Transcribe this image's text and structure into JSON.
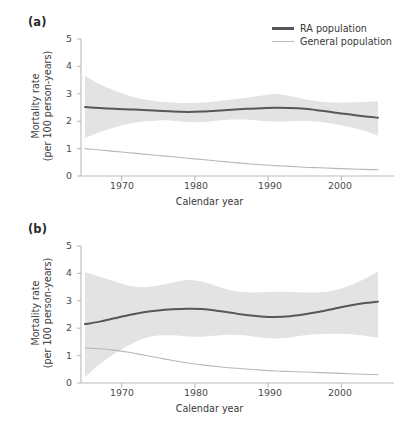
{
  "figure": {
    "background": "#ffffff",
    "panel_label_a": "(a)",
    "panel_label_b": "(b)"
  },
  "legend": {
    "position": "top-right",
    "items": [
      {
        "label": "RA population",
        "color": "#555759",
        "width": 2.2
      },
      {
        "label": "General population",
        "color": "#b5b7b9",
        "width": 1.2
      }
    ]
  },
  "axes": {
    "ylabel_line1": "Mortality rate",
    "ylabel_line2": "(per 100 person-years)",
    "xlabel": "Calendar year",
    "yticks": [
      "5",
      "4",
      "3",
      "2",
      "1",
      "0"
    ],
    "xticks": [
      "1970",
      "1980",
      "1990",
      "2000"
    ],
    "ylim": [
      0,
      5
    ],
    "xlim": [
      1965,
      2005
    ],
    "grid": false,
    "axis_color": "#b9bbbd",
    "band_color": "#e3e3e3"
  },
  "chart_data": [
    {
      "type": "line",
      "panel": "(a)",
      "title": "",
      "xlabel": "Calendar year",
      "ylabel": "Mortality rate (per 100 person-years)",
      "xlim": [
        1965,
        2005
      ],
      "ylim": [
        0,
        5
      ],
      "xticks": [
        1970,
        1980,
        1990,
        2000
      ],
      "yticks": [
        0,
        1,
        2,
        3,
        4,
        5
      ],
      "grid": false,
      "legend_position": "top-right",
      "x": [
        1965,
        1967,
        1969,
        1971,
        1973,
        1975,
        1977,
        1979,
        1981,
        1983,
        1985,
        1987,
        1989,
        1991,
        1993,
        1995,
        1997,
        1999,
        2001,
        2003,
        2005
      ],
      "series": [
        {
          "name": "RA population",
          "color": "#555759",
          "values": [
            2.52,
            2.48,
            2.45,
            2.43,
            2.41,
            2.38,
            2.35,
            2.34,
            2.35,
            2.38,
            2.42,
            2.45,
            2.47,
            2.49,
            2.48,
            2.45,
            2.39,
            2.32,
            2.25,
            2.18,
            2.13
          ],
          "ci_upper": [
            3.66,
            3.35,
            3.12,
            2.93,
            2.8,
            2.72,
            2.68,
            2.66,
            2.68,
            2.73,
            2.79,
            2.86,
            2.93,
            2.99,
            2.92,
            2.8,
            2.72,
            2.68,
            2.68,
            2.7,
            2.73
          ],
          "ci_lower": [
            1.39,
            1.6,
            1.77,
            1.91,
            1.99,
            2.03,
            2.02,
            1.97,
            1.97,
            2.02,
            2.06,
            2.06,
            2.02,
            1.99,
            2.0,
            2.02,
            1.98,
            1.9,
            1.8,
            1.66,
            1.47
          ]
        },
        {
          "name": "General population",
          "color": "#b5b7b9",
          "values": [
            1.0,
            0.95,
            0.9,
            0.85,
            0.8,
            0.75,
            0.7,
            0.65,
            0.6,
            0.55,
            0.5,
            0.45,
            0.41,
            0.38,
            0.35,
            0.32,
            0.3,
            0.28,
            0.26,
            0.24,
            0.23
          ],
          "ci_upper": null,
          "ci_lower": null
        }
      ]
    },
    {
      "type": "line",
      "panel": "(b)",
      "title": "",
      "xlabel": "Calendar year",
      "ylabel": "Mortality rate (per 100 person-years)",
      "xlim": [
        1965,
        2005
      ],
      "ylim": [
        0,
        5
      ],
      "xticks": [
        1970,
        1980,
        1990,
        2000
      ],
      "yticks": [
        0,
        1,
        2,
        3,
        4,
        5
      ],
      "grid": false,
      "legend_position": "none",
      "x": [
        1965,
        1967,
        1969,
        1971,
        1973,
        1975,
        1977,
        1979,
        1981,
        1983,
        1985,
        1987,
        1989,
        1991,
        1993,
        1995,
        1997,
        1999,
        2001,
        2003,
        2005
      ],
      "series": [
        {
          "name": "RA population",
          "color": "#555759",
          "values": [
            2.15,
            2.24,
            2.36,
            2.48,
            2.58,
            2.65,
            2.69,
            2.71,
            2.7,
            2.64,
            2.56,
            2.48,
            2.43,
            2.41,
            2.44,
            2.51,
            2.6,
            2.71,
            2.82,
            2.91,
            2.97
          ],
          "ci_upper": [
            4.04,
            3.88,
            3.71,
            3.55,
            3.5,
            3.56,
            3.67,
            3.76,
            3.7,
            3.53,
            3.38,
            3.31,
            3.31,
            3.33,
            3.32,
            3.3,
            3.31,
            3.38,
            3.54,
            3.78,
            4.06
          ],
          "ci_lower": [
            0.21,
            0.68,
            1.07,
            1.38,
            1.62,
            1.73,
            1.74,
            1.7,
            1.69,
            1.73,
            1.76,
            1.73,
            1.66,
            1.62,
            1.66,
            1.74,
            1.79,
            1.8,
            1.79,
            1.73,
            1.64
          ]
        },
        {
          "name": "General population",
          "color": "#b5b7b9",
          "values": [
            1.28,
            1.25,
            1.2,
            1.12,
            1.02,
            0.92,
            0.82,
            0.73,
            0.66,
            0.6,
            0.55,
            0.51,
            0.47,
            0.44,
            0.42,
            0.4,
            0.38,
            0.36,
            0.34,
            0.32,
            0.3
          ],
          "ci_upper": null,
          "ci_lower": null
        }
      ]
    }
  ]
}
